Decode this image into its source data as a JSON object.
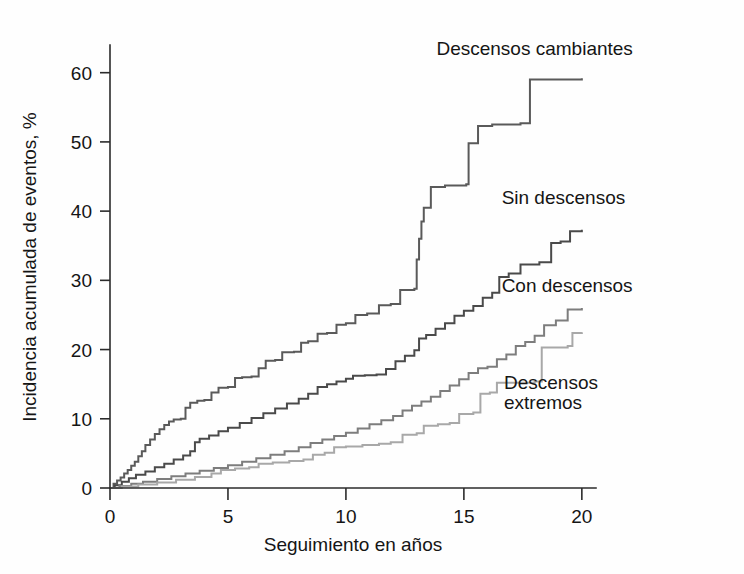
{
  "chart_data": {
    "type": "line",
    "title": "",
    "subtitle": "",
    "xlabel": "Seguimiento en años",
    "ylabel": "Incidencia acumulada de eventos, %",
    "xlim": [
      0,
      20.6
    ],
    "ylim": [
      0,
      64
    ],
    "xticks": [
      0,
      5,
      10,
      15,
      20
    ],
    "xticklabels": [
      "0",
      "5",
      "10",
      "15",
      "20"
    ],
    "yticks": [
      0,
      10,
      20,
      30,
      40,
      50,
      60
    ],
    "yticklabels": [
      "0",
      "10",
      "20",
      "30",
      "40",
      "50",
      "60"
    ],
    "grid": false,
    "legend_position": "inline-annotations",
    "curve_style": "step-post (Kaplan-Meier cumulative incidence)",
    "series": [
      {
        "name": "Descensos cambiantes",
        "color": "#5a5a5a",
        "stroke_width": 2.0,
        "label_x": 18.0,
        "label_y": 62.5,
        "final_value": 59.2,
        "points": [
          [
            0.0,
            0.0
          ],
          [
            0.15,
            0.6
          ],
          [
            0.3,
            1.1
          ],
          [
            0.45,
            1.5
          ],
          [
            0.6,
            2.1
          ],
          [
            0.75,
            2.6
          ],
          [
            0.9,
            3.2
          ],
          [
            1.05,
            3.8
          ],
          [
            1.2,
            4.6
          ],
          [
            1.35,
            5.3
          ],
          [
            1.5,
            6.2
          ],
          [
            1.7,
            7.0
          ],
          [
            1.9,
            7.8
          ],
          [
            2.1,
            8.5
          ],
          [
            2.3,
            9.1
          ],
          [
            2.5,
            9.6
          ],
          [
            2.7,
            9.9
          ],
          [
            3.0,
            10.0
          ],
          [
            3.2,
            11.6
          ],
          [
            3.4,
            12.3
          ],
          [
            3.7,
            12.6
          ],
          [
            4.0,
            12.7
          ],
          [
            4.3,
            13.8
          ],
          [
            4.6,
            14.5
          ],
          [
            5.0,
            14.6
          ],
          [
            5.3,
            15.9
          ],
          [
            5.6,
            16.0
          ],
          [
            6.0,
            16.1
          ],
          [
            6.3,
            17.3
          ],
          [
            6.6,
            18.4
          ],
          [
            7.0,
            18.5
          ],
          [
            7.3,
            19.6
          ],
          [
            7.8,
            19.7
          ],
          [
            8.1,
            21.0
          ],
          [
            8.4,
            21.2
          ],
          [
            8.8,
            22.3
          ],
          [
            9.2,
            22.4
          ],
          [
            9.6,
            23.6
          ],
          [
            10.0,
            23.8
          ],
          [
            10.4,
            25.0
          ],
          [
            10.9,
            25.2
          ],
          [
            11.4,
            26.4
          ],
          [
            11.9,
            26.6
          ],
          [
            12.3,
            28.6
          ],
          [
            12.9,
            28.8
          ],
          [
            13.0,
            33.0
          ],
          [
            13.1,
            36.0
          ],
          [
            13.2,
            38.5
          ],
          [
            13.3,
            40.5
          ],
          [
            13.6,
            43.5
          ],
          [
            14.2,
            43.7
          ],
          [
            15.1,
            43.9
          ],
          [
            15.2,
            49.8
          ],
          [
            15.6,
            52.3
          ],
          [
            16.2,
            52.5
          ],
          [
            17.4,
            52.7
          ],
          [
            17.8,
            59.0
          ],
          [
            20.0,
            59.2
          ]
        ]
      },
      {
        "name": "Sin descensos",
        "color": "#4a4a4a",
        "stroke_width": 2.0,
        "label_x": 16.6,
        "label_y": 41.0,
        "final_value": 37.3,
        "points": [
          [
            0.0,
            0.0
          ],
          [
            0.2,
            0.4
          ],
          [
            0.5,
            0.9
          ],
          [
            0.8,
            1.4
          ],
          [
            1.1,
            1.9
          ],
          [
            1.5,
            2.4
          ],
          [
            1.9,
            3.0
          ],
          [
            2.3,
            3.5
          ],
          [
            2.7,
            4.1
          ],
          [
            3.1,
            4.7
          ],
          [
            3.4,
            5.3
          ],
          [
            3.6,
            6.6
          ],
          [
            3.8,
            7.1
          ],
          [
            4.2,
            7.6
          ],
          [
            4.6,
            8.2
          ],
          [
            5.0,
            8.7
          ],
          [
            5.5,
            9.4
          ],
          [
            6.0,
            10.1
          ],
          [
            6.5,
            10.8
          ],
          [
            7.0,
            11.5
          ],
          [
            7.5,
            12.2
          ],
          [
            8.0,
            12.9
          ],
          [
            8.4,
            13.6
          ],
          [
            8.8,
            14.6
          ],
          [
            9.2,
            15.0
          ],
          [
            9.6,
            15.4
          ],
          [
            10.0,
            15.8
          ],
          [
            10.3,
            16.2
          ],
          [
            10.8,
            16.3
          ],
          [
            11.3,
            16.4
          ],
          [
            11.7,
            17.2
          ],
          [
            12.1,
            18.3
          ],
          [
            12.5,
            19.1
          ],
          [
            12.9,
            19.9
          ],
          [
            13.1,
            21.6
          ],
          [
            13.4,
            22.1
          ],
          [
            13.8,
            23.0
          ],
          [
            14.2,
            23.8
          ],
          [
            14.6,
            24.9
          ],
          [
            15.0,
            25.6
          ],
          [
            15.4,
            26.3
          ],
          [
            15.8,
            27.5
          ],
          [
            16.2,
            28.2
          ],
          [
            16.5,
            30.5
          ],
          [
            16.9,
            31.0
          ],
          [
            17.4,
            32.3
          ],
          [
            18.2,
            32.6
          ],
          [
            18.7,
            35.4
          ],
          [
            19.1,
            35.6
          ],
          [
            19.5,
            37.1
          ],
          [
            20.0,
            37.3
          ]
        ]
      },
      {
        "name": "Con descensos",
        "color": "#7d7d7d",
        "stroke_width": 2.0,
        "label_x": 16.6,
        "label_y": 28.3,
        "final_value": 26.0,
        "points": [
          [
            0.0,
            0.0
          ],
          [
            0.4,
            0.3
          ],
          [
            0.9,
            0.6
          ],
          [
            1.4,
            0.9
          ],
          [
            2.0,
            1.3
          ],
          [
            2.6,
            1.7
          ],
          [
            3.2,
            2.1
          ],
          [
            3.8,
            2.5
          ],
          [
            4.4,
            2.9
          ],
          [
            5.0,
            3.3
          ],
          [
            5.6,
            3.8
          ],
          [
            6.2,
            4.3
          ],
          [
            6.8,
            4.8
          ],
          [
            7.4,
            5.3
          ],
          [
            8.0,
            5.9
          ],
          [
            8.5,
            6.5
          ],
          [
            9.0,
            7.0
          ],
          [
            9.5,
            7.5
          ],
          [
            10.0,
            8.0
          ],
          [
            10.5,
            8.6
          ],
          [
            11.0,
            9.2
          ],
          [
            11.5,
            9.8
          ],
          [
            12.0,
            10.4
          ],
          [
            12.4,
            11.2
          ],
          [
            12.8,
            11.9
          ],
          [
            13.2,
            12.5
          ],
          [
            13.6,
            13.2
          ],
          [
            14.0,
            14.0
          ],
          [
            14.4,
            14.8
          ],
          [
            14.8,
            15.7
          ],
          [
            15.2,
            16.6
          ],
          [
            15.6,
            17.3
          ],
          [
            16.0,
            17.5
          ],
          [
            16.4,
            18.6
          ],
          [
            16.8,
            19.3
          ],
          [
            17.2,
            20.5
          ],
          [
            17.6,
            21.1
          ],
          [
            18.0,
            22.0
          ],
          [
            18.4,
            23.5
          ],
          [
            18.9,
            24.2
          ],
          [
            19.4,
            25.8
          ],
          [
            20.0,
            26.0
          ]
        ]
      },
      {
        "name": "Descensos extremos",
        "color": "#a8a8a8",
        "stroke_width": 2.0,
        "label_x": 16.7,
        "label_y": 14.3,
        "label_line2_y": 11.4,
        "final_value": 22.5,
        "points": [
          [
            0.0,
            0.0
          ],
          [
            0.5,
            0.2
          ],
          [
            1.2,
            0.5
          ],
          [
            2.0,
            0.8
          ],
          [
            2.8,
            1.2
          ],
          [
            3.6,
            1.6
          ],
          [
            4.3,
            2.1
          ],
          [
            4.7,
            2.6
          ],
          [
            5.3,
            2.8
          ],
          [
            5.9,
            3.0
          ],
          [
            6.3,
            3.5
          ],
          [
            6.9,
            3.7
          ],
          [
            7.6,
            3.9
          ],
          [
            8.2,
            4.1
          ],
          [
            8.6,
            4.8
          ],
          [
            9.1,
            5.1
          ],
          [
            9.5,
            5.9
          ],
          [
            10.0,
            6.0
          ],
          [
            10.7,
            6.2
          ],
          [
            11.4,
            6.4
          ],
          [
            11.9,
            6.6
          ],
          [
            12.4,
            7.7
          ],
          [
            13.0,
            7.9
          ],
          [
            13.3,
            9.0
          ],
          [
            13.9,
            9.2
          ],
          [
            14.4,
            9.4
          ],
          [
            14.8,
            10.7
          ],
          [
            15.4,
            10.9
          ],
          [
            15.7,
            13.6
          ],
          [
            16.1,
            13.8
          ],
          [
            16.4,
            15.2
          ],
          [
            18.0,
            15.4
          ],
          [
            18.3,
            20.3
          ],
          [
            19.4,
            20.5
          ],
          [
            19.6,
            22.4
          ],
          [
            20.0,
            22.5
          ]
        ]
      }
    ]
  },
  "axis": {
    "color": "#2b2b2b"
  }
}
